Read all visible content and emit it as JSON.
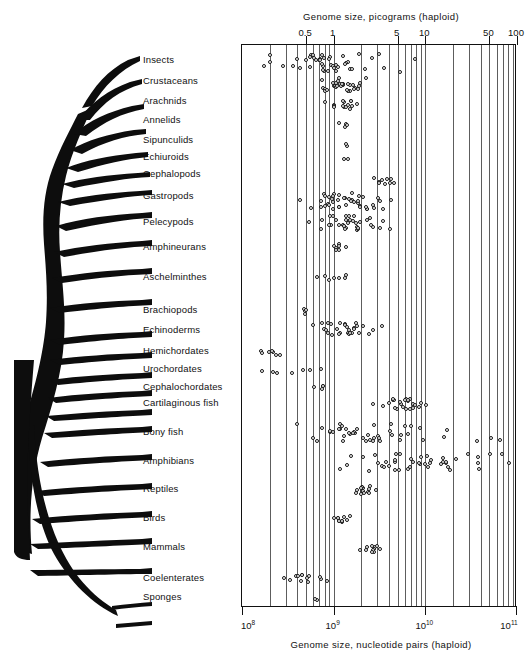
{
  "figure": {
    "top_axis": {
      "title": "Genome size, picograms (haploid)",
      "ticks": [
        {
          "label": "0.5",
          "value": 0.5
        },
        {
          "label": "1",
          "value": 1
        },
        {
          "label": "5",
          "value": 5
        },
        {
          "label": "10",
          "value": 10
        },
        {
          "label": "50",
          "value": 50
        },
        {
          "label": "100",
          "value": 100
        }
      ]
    },
    "bottom_axis": {
      "title": "Genome size, nucleotide pairs (haploid)",
      "ticks": [
        {
          "label": "10",
          "exponent": "8",
          "value": 100000000.0
        },
        {
          "label": "10",
          "exponent": "9",
          "value": 1000000000.0
        },
        {
          "label": "10",
          "exponent": "10",
          "value": 10000000000.0
        },
        {
          "label": "10",
          "exponent": "11",
          "value": 100000000000.0
        }
      ]
    }
  },
  "chart_data": {
    "type": "scatter",
    "title": "Genome size, picograms (haploid)",
    "xlabel": "Genome size, nucleotide pairs (haploid)",
    "ylabel": "Taxonomic group",
    "xscale": "log",
    "xlim": [
      100000000,
      100000000000
    ],
    "grid": true,
    "legend": null,
    "note": "Each open circle is one species; x = haploid genome size. Rows are taxonomic groups joined by the phylogenetic tree at left.",
    "categories": [
      "Insects",
      "Crustaceans",
      "Arachnids",
      "Annelids",
      "Sipunculids",
      "Echiuroids",
      "Cephalopods",
      "Gastropods",
      "Pelecypods",
      "Amphineurans",
      "Aschelminthes",
      "Brachiopods",
      "Echinoderms",
      "Hemichordates",
      "Urochordates",
      "Cephalochordates",
      "Cartilaginous fish",
      "Bony fish",
      "Amphibians",
      "Reptiles",
      "Birds",
      "Mammals",
      "Coelenterates",
      "Sponges"
    ],
    "series": [
      {
        "name": "Insects",
        "y": 62,
        "range_pg": [
          0.1,
          8
        ],
        "values_pg": [
          0.1,
          0.2,
          0.53,
          0.56,
          0.62,
          0.65,
          0.68,
          0.72,
          0.78,
          0.88,
          0.92,
          0.98,
          1.1,
          1.3,
          1.5,
          1.8,
          2.2,
          2.6,
          3.1,
          5.0,
          7.5
        ]
      },
      {
        "name": "Crustaceans",
        "y": 84,
        "range_pg": [
          0.7,
          2.2
        ],
        "values_pg": [
          0.72,
          0.78,
          0.82,
          0.86,
          0.9,
          0.95,
          1.0,
          1.1,
          1.2,
          1.4,
          1.6,
          1.75,
          1.9,
          2.1
        ]
      },
      {
        "name": "Arachnids",
        "y": 104,
        "range_pg": [
          0.8,
          2.0
        ],
        "values_pg": [
          0.85,
          0.95,
          1.05,
          1.2,
          1.45,
          1.6,
          1.8
        ]
      },
      {
        "name": "Annelids",
        "y": 123,
        "range_pg": [
          1.1,
          1.6
        ],
        "values_pg": [
          1.15,
          1.4
        ]
      },
      {
        "name": "Sipunculids",
        "y": 143,
        "range_pg": [
          1.2,
          1.6
        ],
        "values_pg": [
          1.3
        ]
      },
      {
        "name": "Echiuroids",
        "y": 160,
        "range_pg": [
          1.2,
          1.5
        ],
        "values_pg": [
          1.35
        ]
      },
      {
        "name": "Cephalopods",
        "y": 180,
        "range_pg": [
          2.5,
          5.5
        ],
        "values_pg": [
          2.8,
          3.3,
          4.2,
          4.8
        ]
      },
      {
        "name": "Gastropods",
        "y": 200,
        "range_pg": [
          0.45,
          4.4
        ],
        "values_pg": [
          0.46,
          0.6,
          0.68,
          0.72,
          0.8,
          0.88,
          0.95,
          1.05,
          1.2,
          1.4,
          1.6,
          1.8,
          2.0,
          2.3,
          2.6,
          2.9,
          3.2,
          3.6,
          4.0
        ]
      },
      {
        "name": "Pelecypods",
        "y": 222,
        "range_pg": [
          0.55,
          4.2
        ],
        "values_pg": [
          0.58,
          0.7,
          0.8,
          0.9,
          1.0,
          1.1,
          1.25,
          1.4,
          1.6,
          1.85,
          2.1,
          2.4,
          2.8,
          3.2,
          3.7,
          4.0
        ]
      },
      {
        "name": "Amphineurans",
        "y": 246,
        "range_pg": [
          0.9,
          1.4
        ],
        "values_pg": [
          0.95,
          1.15,
          1.3
        ]
      },
      {
        "name": "Aschelminthes",
        "y": 276,
        "range_pg": [
          0.6,
          1.6
        ],
        "values_pg": [
          0.62,
          0.95,
          1.4
        ]
      },
      {
        "name": "Brachiopods",
        "y": 310,
        "range_pg": [
          0.45,
          0.52
        ],
        "values_pg": [
          0.46,
          0.5
        ]
      },
      {
        "name": "Echinoderms",
        "y": 328,
        "range_pg": [
          0.55,
          3.4
        ],
        "values_pg": [
          0.6,
          0.72,
          0.82,
          0.9,
          1.0,
          1.15,
          1.3,
          1.5,
          1.7,
          2.0,
          2.3,
          2.7,
          3.2
        ]
      },
      {
        "name": "Hemichordates",
        "y": 351,
        "range_pg": [
          0.15,
          0.3
        ],
        "values_pg": [
          0.16,
          0.21,
          0.25
        ]
      },
      {
        "name": "Urochordates",
        "y": 369,
        "range_pg": [
          0.17,
          0.8
        ],
        "values_pg": [
          0.18,
          0.22,
          0.7
        ]
      },
      {
        "name": "Cephalochordates",
        "y": 387,
        "range_pg": [
          0.6,
          0.9
        ],
        "values_pg": [
          0.65,
          0.8
        ]
      },
      {
        "name": "Cartilaginous fish",
        "y": 404,
        "range_pg": [
          2.8,
          12
        ],
        "values_pg": [
          2.9,
          3.4,
          3.8,
          4.2,
          4.8,
          5.4,
          6.0,
          6.8,
          7.6,
          8.5,
          9.6
        ]
      },
      {
        "name": "Bony fish",
        "y": 432,
        "range_pg": [
          0.4,
          140
        ],
        "values_pg": [
          0.42,
          0.6,
          0.7,
          0.8,
          0.9,
          1.0,
          1.1,
          1.2,
          1.3,
          1.45,
          1.6,
          1.8,
          2.0,
          2.2,
          2.5,
          2.9,
          3.3,
          3.8,
          4.4,
          5.2,
          100
        ]
      },
      {
        "name": "Amphibians",
        "y": 461,
        "range_pg": [
          1.0,
          90
        ],
        "values_pg": [
          1.1,
          1.6,
          2.2,
          3.0,
          3.6,
          4.2,
          4.8,
          5.5,
          6.4,
          7.2,
          8.5,
          10,
          12,
          15,
          20,
          28,
          40,
          55,
          70,
          85
        ]
      },
      {
        "name": "Reptiles",
        "y": 489,
        "range_pg": [
          1.6,
          3.0
        ],
        "values_pg": [
          1.7,
          1.9,
          2.0,
          2.2,
          2.4,
          2.6,
          2.8
        ]
      },
      {
        "name": "Birds",
        "y": 518,
        "range_pg": [
          1.0,
          1.5
        ],
        "values_pg": [
          1.05,
          1.15,
          1.25,
          1.35,
          1.45
        ]
      },
      {
        "name": "Mammals",
        "y": 548,
        "range_pg": [
          2.0,
          3.2
        ],
        "values_pg": [
          2.1,
          2.4,
          2.6,
          2.9,
          3.1
        ]
      },
      {
        "name": "Coelenterates",
        "y": 578,
        "range_pg": [
          0.25,
          0.9
        ],
        "values_pg": [
          0.27,
          0.35,
          0.42,
          0.55,
          0.72,
          0.85
        ]
      },
      {
        "name": "Sponges",
        "y": 597,
        "range_pg": [
          0.6,
          0.8
        ],
        "values_pg": [
          0.7
        ]
      }
    ]
  },
  "taxa": [
    {
      "label": "Insects",
      "y": 60
    },
    {
      "label": "Crustaceans",
      "y": 81
    },
    {
      "label": "Arachnids",
      "y": 101
    },
    {
      "label": "Annelids",
      "y": 120
    },
    {
      "label": "Sipunculids",
      "y": 140
    },
    {
      "label": "Echiuroids",
      "y": 157
    },
    {
      "label": "Cephalopods",
      "y": 174
    },
    {
      "label": "Gastropods",
      "y": 196
    },
    {
      "label": "Pelecypods",
      "y": 222
    },
    {
      "label": "Amphineurans",
      "y": 247
    },
    {
      "label": "Aschelminthes",
      "y": 277
    },
    {
      "label": "Brachiopods",
      "y": 310
    },
    {
      "label": "Echinoderms",
      "y": 330
    },
    {
      "label": "Hemichordates",
      "y": 351
    },
    {
      "label": "Urochordates",
      "y": 369
    },
    {
      "label": "Cephalochordates",
      "y": 387
    },
    {
      "label": "Cartilaginous fish",
      "y": 403
    },
    {
      "label": "Bony fish",
      "y": 432
    },
    {
      "label": "Amphibians",
      "y": 461
    },
    {
      "label": "Reptiles",
      "y": 489
    },
    {
      "label": "Birds",
      "y": 518
    },
    {
      "label": "Mammals",
      "y": 547
    },
    {
      "label": "Coelenterates",
      "y": 578
    },
    {
      "label": "Sponges",
      "y": 597
    }
  ],
  "colors": {
    "ink": "#111111",
    "gridline": "#5d5d5d",
    "point_fill": "#ffffff",
    "background": "#ffffff"
  }
}
